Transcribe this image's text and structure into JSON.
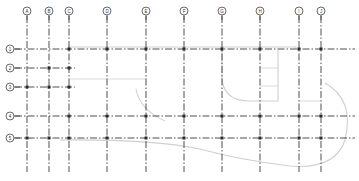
{
  "drawing": {
    "type": "structural-grid-plan",
    "columns": [
      {
        "label": "A",
        "x": 27
      },
      {
        "label": "B",
        "x": 49
      },
      {
        "label": "C",
        "x": 69
      },
      {
        "label": "D",
        "x": 107
      },
      {
        "label": "E",
        "x": 146
      },
      {
        "label": "F",
        "x": 184
      },
      {
        "label": "G",
        "x": 222
      },
      {
        "label": "H",
        "x": 260
      },
      {
        "label": "I",
        "x": 299
      },
      {
        "label": "J",
        "x": 321
      }
    ],
    "rows": [
      {
        "label": "1",
        "y": 49
      },
      {
        "label": "2",
        "y": 68
      },
      {
        "label": "3",
        "y": 87
      },
      {
        "label": "4",
        "y": 116
      },
      {
        "label": "5",
        "y": 138
      }
    ],
    "colors": {
      "grid_line": "#3a3a3a",
      "bubble_stroke": "#444444",
      "node": "#2a2a2a",
      "building_outline": "#cfcfcf",
      "background": "#ffffff"
    }
  }
}
